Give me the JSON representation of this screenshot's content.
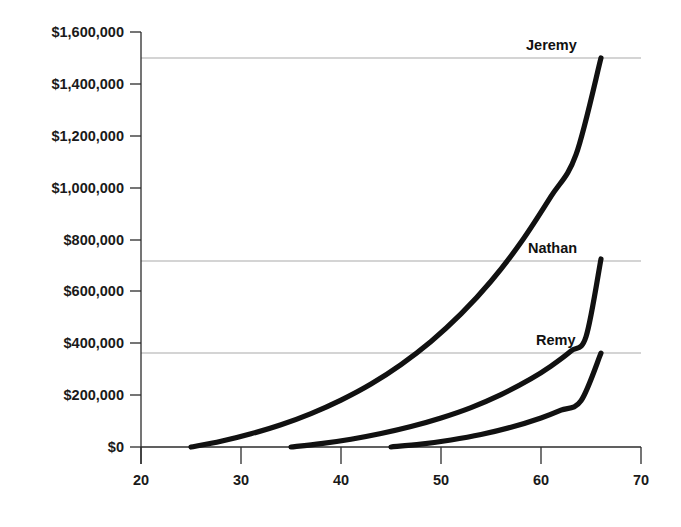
{
  "chart_data": {
    "type": "line",
    "title": "",
    "subtitle": "",
    "xlabel": "",
    "ylabel": "",
    "xlim": [
      20,
      70
    ],
    "ylim": [
      0,
      1600000
    ],
    "grid": true,
    "grid_orientation": "horizontal",
    "gridline_values": [
      1500000,
      725000,
      362000
    ],
    "legend_position": "inline-end-of-curve",
    "x_ticks": [
      20,
      30,
      40,
      50,
      60,
      70
    ],
    "x_tick_labels": [
      "20",
      "30",
      "40",
      "50",
      "60",
      "70"
    ],
    "y_ticks": [
      0,
      200000,
      400000,
      600000,
      800000,
      1000000,
      1200000,
      1400000,
      1600000
    ],
    "y_tick_labels": [
      "$0",
      "$200,000",
      "$400,000",
      "$600,000",
      "$800,000",
      "$1,000,000",
      "$1,200,000",
      "$1,400,000",
      "$1,600,000"
    ],
    "series": [
      {
        "name": "Jeremy",
        "label": "Jeremy",
        "color": "#111111",
        "start_x": 25,
        "end_x": 66,
        "end_value": 1500000,
        "x": [
          25,
          28,
          31,
          34,
          37,
          40,
          43,
          46,
          49,
          52,
          55,
          58,
          61,
          63.5,
          66
        ],
        "values": [
          0,
          22000,
          51000,
          86000,
          129000,
          181000,
          243000,
          318000,
          407000,
          513000,
          639000,
          789000,
          966000,
          1127000,
          1500000
        ]
      },
      {
        "name": "Nathan",
        "label": "Nathan",
        "color": "#111111",
        "start_x": 35,
        "end_x": 66,
        "end_value": 725000,
        "x": [
          35,
          38,
          41,
          44,
          47,
          50,
          53,
          56,
          59,
          61,
          63,
          64.5,
          66
        ],
        "values": [
          0,
          13000,
          30000,
          52000,
          79000,
          112000,
          152000,
          202000,
          263000,
          312000,
          370000,
          425000,
          725000
        ]
      },
      {
        "name": "Remy",
        "label": "Remy",
        "color": "#111111",
        "start_x": 45,
        "end_x": 66,
        "end_value": 362000,
        "x": [
          45,
          48,
          51,
          54,
          57,
          60,
          62,
          64,
          66
        ],
        "values": [
          0,
          11000,
          27000,
          48000,
          76000,
          112000,
          142000,
          178000,
          362000
        ]
      }
    ]
  },
  "labels": {
    "jeremy": "Jeremy",
    "nathan": "Nathan",
    "remy": "Remy"
  },
  "yticks": {
    "t0": "$0",
    "t1": "$200,000",
    "t2": "$400,000",
    "t3": "$600,000",
    "t4": "$800,000",
    "t5": "$1,000,000",
    "t6": "$1,200,000",
    "t7": "$1,400,000",
    "t8": "$1,600,000"
  },
  "xticks": {
    "t0": "20",
    "t1": "30",
    "t2": "40",
    "t3": "50",
    "t4": "60",
    "t5": "70"
  },
  "colors": {
    "curve": "#111111",
    "axis": "#2b2b2b",
    "grid": "#a9a9a9",
    "background": "#ffffff",
    "text": "#1a1a1a"
  }
}
